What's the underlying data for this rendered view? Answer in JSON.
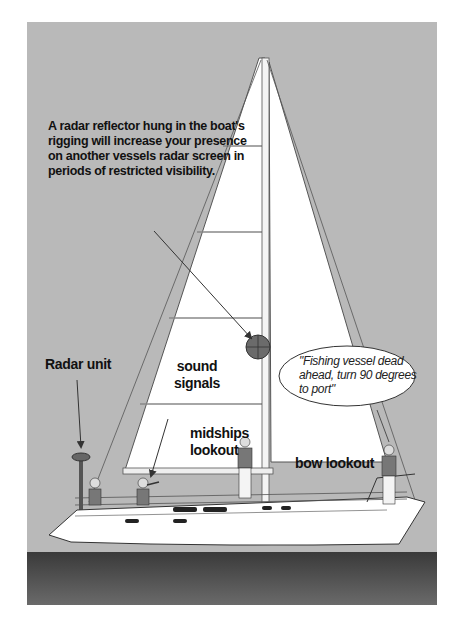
{
  "figure": {
    "colors": {
      "sky": "#b9b9b9",
      "sea": "#4a4a4a",
      "sail": "#ffffff",
      "hull": "#ffffff",
      "outline": "#333333",
      "reflector": "#6b6b6b"
    },
    "annotations": {
      "radar_reflector_note": "A radar reflector hung in the boat's rigging will increase your presence on another vessels radar screen in periods of restricted visibility.",
      "radar_unit": "Radar unit",
      "sound_signals_line1": "sound",
      "sound_signals_line2": "signals",
      "midships_line1": "midships",
      "midships_line2": "lookout",
      "bow_lookout": "bow lookout",
      "speech_bubble": "\"Fishing vessel dead ahead, turn 90 degrees to port\""
    }
  }
}
